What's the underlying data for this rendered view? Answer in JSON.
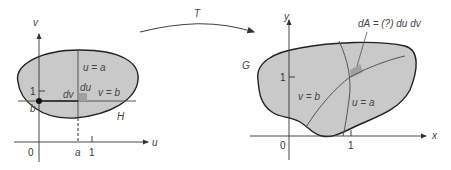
{
  "left_panel": {
    "axis_x_label": "u",
    "axis_y_label": "v",
    "origin_label": "0",
    "tick_x_1": "1",
    "tick_y_1": "1",
    "point_a_label": "a",
    "point_b_label": "b",
    "curve_u_label": "u = a",
    "curve_v_label": "v = b",
    "du_label": "du",
    "dv_label": "dv",
    "region_label": "H"
  },
  "transform": {
    "label": "T"
  },
  "right_panel": {
    "axis_x_label": "x",
    "axis_y_label": "y",
    "origin_label": "0",
    "tick_x_1": "1",
    "tick_y_1": "1",
    "curve_u_label": "u = a",
    "curve_v_label": "v = b",
    "region_label": "G",
    "area_element_label": "dA = (?) du dv"
  },
  "colors": {
    "region_fill": "#c9c9c9",
    "patch_fill": "#a0a0a0",
    "outline": "#222222"
  }
}
